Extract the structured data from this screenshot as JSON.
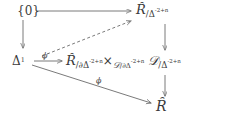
{
  "diagram": {
    "type": "commutative-diagram",
    "nodes": {
      "zero": {
        "name": "zero-object",
        "text": "{0}"
      },
      "delta1": {
        "name": "delta-one-object",
        "base": "Δ",
        "exponent": "1"
      },
      "c_over_delta": {
        "name": "c-over-delta-object",
        "script": "Ȓ",
        "slash": "/",
        "base": "Δ",
        "exponent": "-2+n"
      },
      "fiber_product": {
        "name": "fiber-product-object",
        "left_script": "Ȓ",
        "left_slash": "/",
        "left_boundary": "∂Δ",
        "left_exponent": "-2+n",
        "times": "×",
        "mid_script": "𝒟",
        "mid_slash": "/",
        "mid_boundary": "∂Δ",
        "mid_exponent": "-2+n",
        "right_script": "𝒟",
        "right_slash": "/",
        "right_base": "Δ",
        "right_exponent": "-2+n"
      },
      "c_target": {
        "name": "c-target-object",
        "script": "Ȓ"
      }
    },
    "labels": {
      "phi_prime": "ϕ",
      "phi_prime_mark": "′",
      "phi": "ϕ"
    },
    "arrows": [
      {
        "name": "arrow-zero-to-c-over-delta",
        "style": "solid",
        "direction": "right"
      },
      {
        "name": "arrow-zero-to-delta1",
        "style": "solid",
        "direction": "down"
      },
      {
        "name": "arrow-delta1-to-c-over-delta-dashed",
        "style": "dashed",
        "direction": "up-right"
      },
      {
        "name": "arrow-delta1-to-fiber-product",
        "style": "solid",
        "direction": "right"
      },
      {
        "name": "arrow-delta1-to-c-target",
        "style": "solid",
        "direction": "down-right"
      },
      {
        "name": "arrow-c-over-delta-to-fiber-product",
        "style": "solid",
        "direction": "down"
      },
      {
        "name": "arrow-fiber-product-to-c-target",
        "style": "solid",
        "direction": "down"
      }
    ],
    "colors": {
      "ink": "#3a3a3a",
      "arrow": "#6b6b6b",
      "background": "#ffffff"
    }
  }
}
